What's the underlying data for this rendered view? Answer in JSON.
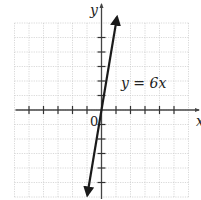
{
  "chart_data": {
    "type": "line",
    "title": "",
    "equation_label": "y = 6x",
    "xlabel": "x",
    "ylabel": "y",
    "origin_label": "0",
    "xlim": [
      -6,
      6
    ],
    "ylim": [
      -6,
      6
    ],
    "grid": true,
    "tick_spacing": 1,
    "x_ticks": [
      -5,
      -4,
      -3,
      -2,
      -1,
      1,
      2,
      3,
      4,
      5
    ],
    "y_ticks": [
      -5,
      -4,
      -3,
      -2,
      -1,
      1,
      2,
      3,
      4,
      5
    ],
    "series": [
      {
        "name": "y = 6x",
        "slope": 6,
        "intercept": 0,
        "x": [
          -1,
          0,
          1
        ],
        "y": [
          -6,
          0,
          6
        ],
        "arrows_both_ends": true
      }
    ]
  },
  "labels": {
    "x_axis": "x",
    "y_axis": "y",
    "origin": "0",
    "equation": "y = 6x"
  }
}
